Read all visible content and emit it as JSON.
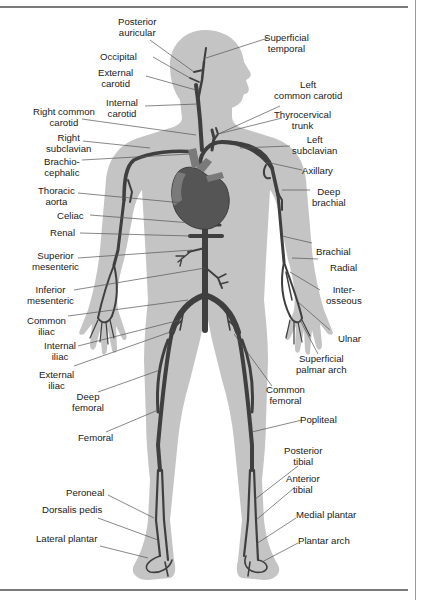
{
  "diagram": {
    "colors": {
      "silhouette": "#c4c4c4",
      "artery": "#3f3f3f",
      "heart": "#555555",
      "heart_vessels": "#7a7a7a",
      "leader_line": "#555555",
      "label_text": "#1a1a1a",
      "rule": "#7a7a7a"
    },
    "labels": {
      "posterior_auricular": {
        "line1": "Posterior",
        "line2": "auricular"
      },
      "occipital": {
        "line1": "Occipital"
      },
      "external_carotid": {
        "line1": "External",
        "line2": "carotid"
      },
      "internal_carotid": {
        "line1": "Internal",
        "line2": "carotid"
      },
      "right_common_carotid": {
        "line1": "Right common",
        "line2": "carotid"
      },
      "right_subclavian": {
        "line1": "Right",
        "line2": "subclavian"
      },
      "brachiocephalic": {
        "line1": "Brachio-",
        "line2": "cephalic"
      },
      "thoracic_aorta": {
        "line1": "Thoracic",
        "line2": "aorta"
      },
      "celiac": {
        "line1": "Celiac"
      },
      "renal": {
        "line1": "Renal"
      },
      "superior_mesenteric": {
        "line1": "Superior",
        "line2": "mesenteric"
      },
      "inferior_mesenteric": {
        "line1": "Inferior",
        "line2": "mesenteric"
      },
      "common_iliac": {
        "line1": "Common",
        "line2": "iliac"
      },
      "internal_iliac": {
        "line1": "Internal",
        "line2": "iliac"
      },
      "external_iliac": {
        "line1": "External",
        "line2": "iliac"
      },
      "deep_femoral": {
        "line1": "Deep",
        "line2": "femoral"
      },
      "femoral": {
        "line1": "Femoral"
      },
      "peroneal": {
        "line1": "Peroneal"
      },
      "dorsalis_pedis": {
        "line1": "Dorsalis pedis"
      },
      "lateral_plantar": {
        "line1": "Lateral plantar"
      },
      "superficial_temporal": {
        "line1": "Superficial",
        "line2": "temporal"
      },
      "left_common_carotid": {
        "line1": "Left",
        "line2": "common carotid"
      },
      "thyrocervical_trunk": {
        "line1": "Thyrocervical",
        "line2": "trunk"
      },
      "left_subclavian": {
        "line1": "Left",
        "line2": "subclavian"
      },
      "axillary": {
        "line1": "Axillary"
      },
      "deep_brachial": {
        "line1": "Deep",
        "line2": "brachial"
      },
      "brachial": {
        "line1": "Brachial"
      },
      "radial": {
        "line1": "Radial"
      },
      "interosseous": {
        "line1": "Inter-",
        "line2": "osseous"
      },
      "ulnar": {
        "line1": "Ulnar"
      },
      "superficial_palmar_arch": {
        "line1": "Superficial",
        "line2": "palmar arch"
      },
      "common_femoral": {
        "line1": "Common",
        "line2": "femoral"
      },
      "popliteal": {
        "line1": "Popliteal"
      },
      "posterior_tibial": {
        "line1": "Posterior",
        "line2": "tibial"
      },
      "anterior_tibial": {
        "line1": "Anterior",
        "line2": "tibial"
      },
      "medial_plantar": {
        "line1": "Medial plantar"
      },
      "plantar_arch": {
        "line1": "Plantar arch"
      }
    }
  }
}
